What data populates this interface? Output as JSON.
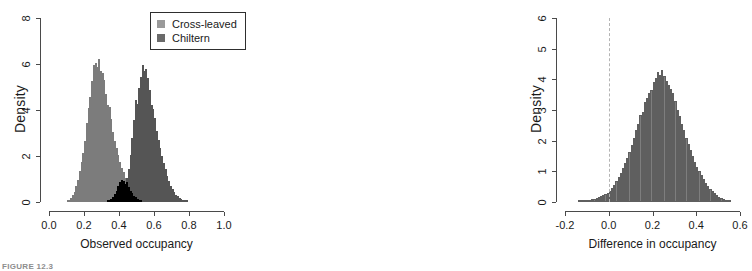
{
  "figure": {
    "caption": "FIGURE 12.3"
  },
  "chart_data": [
    {
      "id": "observed-occupancy",
      "type": "bar",
      "subtype": "histogram",
      "title": "",
      "xlabel": "Observed occupancy",
      "ylabel": "Density",
      "xlim": [
        0.0,
        1.0
      ],
      "ylim": [
        0,
        8
      ],
      "xticks": [
        "0.0",
        "0.2",
        "0.4",
        "0.6",
        "0.8",
        "1.0"
      ],
      "xtick_values": [
        0.0,
        0.2,
        0.4,
        0.6,
        0.8,
        1.0
      ],
      "yticks": [
        "0",
        "2",
        "4",
        "6",
        "8"
      ],
      "ytick_values": [
        0,
        2,
        4,
        6,
        8
      ],
      "grid": false,
      "legend_position": "top-right",
      "legend": [
        "Cross-leaved",
        "Chiltern"
      ],
      "colors": {
        "cross_leaved": "#9a9a9a",
        "chiltern": "#6a6a6a",
        "overlap": "#1b1b1b"
      },
      "bin_width": 0.01,
      "series": [
        {
          "name": "Cross-leaved",
          "color": "#9a9a9a",
          "bin_starts": [
            0.1,
            0.11,
            0.12,
            0.13,
            0.14,
            0.15,
            0.16,
            0.17,
            0.18,
            0.19,
            0.2,
            0.21,
            0.22,
            0.23,
            0.24,
            0.25,
            0.26,
            0.27,
            0.28,
            0.29,
            0.3,
            0.31,
            0.32,
            0.33,
            0.34,
            0.35,
            0.36,
            0.37,
            0.38,
            0.39,
            0.4,
            0.41,
            0.42,
            0.43,
            0.44,
            0.45,
            0.46,
            0.47,
            0.48,
            0.49,
            0.5,
            0.51,
            0.52
          ],
          "values": [
            0.05,
            0.1,
            0.18,
            0.3,
            0.45,
            0.7,
            0.95,
            1.35,
            1.75,
            2.15,
            2.65,
            3.45,
            4.1,
            4.55,
            5.25,
            5.95,
            6.05,
            5.85,
            6.2,
            5.7,
            5.6,
            5.3,
            4.7,
            4.2,
            4.15,
            3.6,
            3.05,
            2.65,
            2.35,
            2.05,
            1.75,
            1.5,
            1.3,
            1.05,
            0.85,
            0.65,
            0.5,
            0.38,
            0.28,
            0.2,
            0.14,
            0.08,
            0.04
          ]
        },
        {
          "name": "Chiltern",
          "color": "#6a6a6a",
          "bin_starts": [
            0.33,
            0.34,
            0.35,
            0.36,
            0.37,
            0.38,
            0.39,
            0.4,
            0.41,
            0.42,
            0.43,
            0.44,
            0.45,
            0.46,
            0.47,
            0.48,
            0.49,
            0.5,
            0.51,
            0.52,
            0.53,
            0.54,
            0.55,
            0.56,
            0.57,
            0.58,
            0.59,
            0.6,
            0.61,
            0.62,
            0.63,
            0.64,
            0.65,
            0.66,
            0.67,
            0.68,
            0.69,
            0.7,
            0.71,
            0.72,
            0.73,
            0.74,
            0.75,
            0.76,
            0.77,
            0.78
          ],
          "values": [
            0.04,
            0.08,
            0.14,
            0.22,
            0.34,
            0.5,
            0.68,
            0.85,
            0.95,
            0.9,
            0.8,
            1.05,
            1.45,
            2.05,
            2.8,
            3.55,
            4.45,
            4.25,
            4.95,
            5.45,
            5.95,
            5.7,
            5.8,
            5.4,
            4.85,
            4.2,
            4.05,
            3.65,
            3.1,
            2.7,
            2.35,
            2.0,
            1.7,
            1.45,
            1.15,
            0.9,
            0.7,
            0.55,
            0.42,
            0.32,
            0.24,
            0.17,
            0.12,
            0.08,
            0.05,
            0.03
          ]
        }
      ]
    },
    {
      "id": "difference-in-occupancy",
      "type": "bar",
      "subtype": "histogram",
      "title": "",
      "xlabel": "Difference in occupancy",
      "ylabel": "Density",
      "xlim": [
        -0.2,
        0.6
      ],
      "ylim": [
        0,
        6
      ],
      "xticks": [
        "-0.2",
        "0.0",
        "0.2",
        "0.4",
        "0.6"
      ],
      "xtick_values": [
        -0.2,
        0.0,
        0.2,
        0.4,
        0.6
      ],
      "yticks": [
        "0",
        "1",
        "2",
        "3",
        "4",
        "5",
        "6"
      ],
      "ytick_values": [
        0,
        1,
        2,
        3,
        4,
        5,
        6
      ],
      "grid": false,
      "legend_position": "none",
      "reference_line": {
        "x": 0.0,
        "style": "dashed",
        "color": "#b4b4b4"
      },
      "colors": {
        "bars": "#7e7e7e"
      },
      "bin_width": 0.01,
      "series": [
        {
          "name": "Difference",
          "color": "#7e7e7e",
          "bin_starts": [
            -0.14,
            -0.13,
            -0.12,
            -0.11,
            -0.1,
            -0.09,
            -0.08,
            -0.07,
            -0.06,
            -0.05,
            -0.04,
            -0.03,
            -0.02,
            -0.01,
            0.0,
            0.01,
            0.02,
            0.03,
            0.04,
            0.05,
            0.06,
            0.07,
            0.08,
            0.09,
            0.1,
            0.11,
            0.12,
            0.13,
            0.14,
            0.15,
            0.16,
            0.17,
            0.18,
            0.19,
            0.2,
            0.21,
            0.22,
            0.23,
            0.24,
            0.25,
            0.26,
            0.27,
            0.28,
            0.29,
            0.3,
            0.31,
            0.32,
            0.33,
            0.34,
            0.35,
            0.36,
            0.37,
            0.38,
            0.39,
            0.4,
            0.41,
            0.42,
            0.43,
            0.44,
            0.45,
            0.46,
            0.47,
            0.48,
            0.49,
            0.5,
            0.51,
            0.52,
            0.53,
            0.54,
            0.55
          ],
          "values": [
            0.02,
            0.03,
            0.04,
            0.05,
            0.06,
            0.08,
            0.09,
            0.11,
            0.13,
            0.15,
            0.18,
            0.22,
            0.26,
            0.3,
            0.36,
            0.45,
            0.55,
            0.68,
            0.82,
            0.95,
            1.1,
            1.28,
            1.45,
            1.62,
            1.85,
            2.1,
            2.35,
            2.55,
            2.85,
            2.95,
            3.25,
            3.4,
            3.55,
            3.65,
            3.9,
            4.05,
            4.25,
            4.15,
            4.3,
            4.1,
            3.95,
            3.8,
            3.7,
            3.55,
            3.3,
            3.0,
            2.8,
            2.55,
            2.35,
            2.1,
            1.9,
            1.7,
            1.5,
            1.3,
            1.15,
            1.0,
            0.88,
            0.75,
            0.62,
            0.52,
            0.44,
            0.36,
            0.28,
            0.22,
            0.17,
            0.13,
            0.1,
            0.07,
            0.05,
            0.03
          ]
        }
      ]
    }
  ]
}
